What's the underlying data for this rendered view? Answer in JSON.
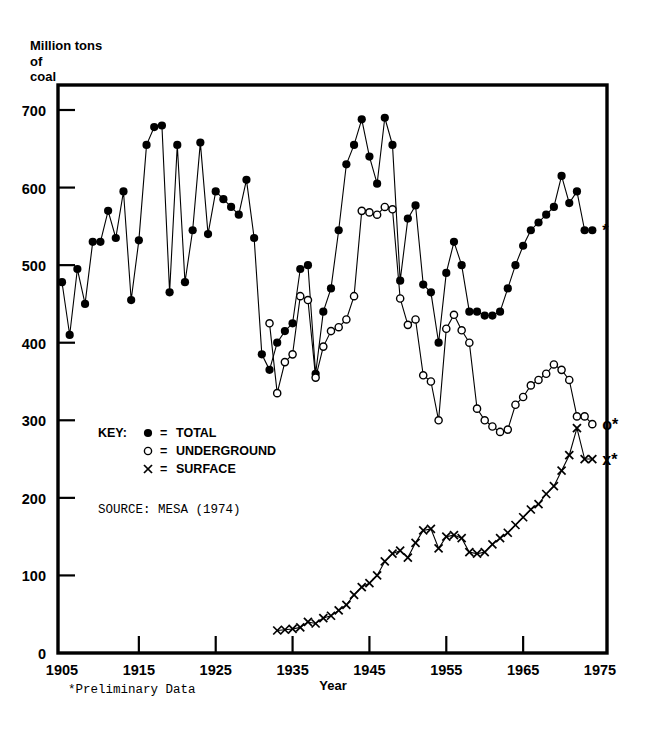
{
  "chart_data": {
    "type": "line",
    "title": "",
    "xlabel": "Year",
    "ylabel": "Million tons of coal",
    "ylabel_lines": [
      "Million tons",
      "of",
      "coal"
    ],
    "xlim": [
      1905,
      1975
    ],
    "ylim": [
      0,
      700
    ],
    "x_ticks": [
      1905,
      1915,
      1925,
      1935,
      1945,
      1955,
      1965,
      1975
    ],
    "y_ticks": [
      0,
      100,
      200,
      300,
      400,
      500,
      600,
      700
    ],
    "grid": false,
    "legend_position": "inside-left",
    "legend_title": "KEY:",
    "series": [
      {
        "name": "TOTAL",
        "marker": "filled-circle",
        "marker_symbol": "●",
        "x": [
          1905,
          1906,
          1907,
          1908,
          1909,
          1910,
          1911,
          1912,
          1913,
          1914,
          1915,
          1916,
          1917,
          1918,
          1919,
          1920,
          1921,
          1922,
          1923,
          1924,
          1925,
          1926,
          1927,
          1928,
          1929,
          1930,
          1931,
          1932,
          1933,
          1934,
          1935,
          1936,
          1937,
          1938,
          1939,
          1940,
          1941,
          1942,
          1943,
          1944,
          1945,
          1946,
          1947,
          1948,
          1949,
          1950,
          1951,
          1952,
          1953,
          1954,
          1955,
          1956,
          1957,
          1958,
          1959,
          1960,
          1961,
          1962,
          1963,
          1964,
          1965,
          1966,
          1967,
          1968,
          1969,
          1970,
          1971,
          1972,
          1973,
          1974
        ],
        "values": [
          478,
          410,
          495,
          450,
          530,
          530,
          570,
          535,
          595,
          455,
          532,
          655,
          678,
          680,
          465,
          655,
          478,
          545,
          658,
          540,
          595,
          585,
          575,
          565,
          610,
          535,
          385,
          365,
          400,
          415,
          425,
          495,
          500,
          360,
          440,
          470,
          545,
          630,
          655,
          688,
          640,
          605,
          690,
          655,
          480,
          560,
          577,
          475,
          465,
          400,
          490,
          530,
          500,
          440,
          440,
          435,
          435,
          440,
          470,
          500,
          525,
          545,
          555,
          565,
          575,
          615,
          580,
          595,
          545,
          545
        ],
        "units": "million tons"
      },
      {
        "name": "UNDERGROUND",
        "marker": "open-circle",
        "marker_symbol": "o",
        "x": [
          1932,
          1933,
          1934,
          1935,
          1936,
          1937,
          1938,
          1939,
          1940,
          1941,
          1942,
          1943,
          1944,
          1945,
          1946,
          1947,
          1948,
          1949,
          1950,
          1951,
          1952,
          1953,
          1954,
          1955,
          1956,
          1957,
          1958,
          1959,
          1960,
          1961,
          1962,
          1963,
          1964,
          1965,
          1966,
          1967,
          1968,
          1969,
          1970,
          1971,
          1972,
          1973,
          1974
        ],
        "values": [
          425,
          335,
          375,
          385,
          460,
          455,
          355,
          395,
          415,
          420,
          430,
          460,
          570,
          568,
          565,
          575,
          572,
          457,
          423,
          430,
          358,
          350,
          300,
          418,
          436,
          416,
          400,
          315,
          300,
          292,
          285,
          288,
          320,
          330,
          345,
          352,
          360,
          372,
          365,
          352,
          305,
          305,
          295
        ],
        "units": "million tons"
      },
      {
        "name": "SURFACE",
        "marker": "cross",
        "marker_symbol": "x",
        "x": [
          1933,
          1934,
          1935,
          1936,
          1937,
          1938,
          1939,
          1940,
          1941,
          1942,
          1943,
          1944,
          1945,
          1946,
          1947,
          1948,
          1949,
          1950,
          1951,
          1952,
          1953,
          1954,
          1955,
          1956,
          1957,
          1958,
          1959,
          1960,
          1961,
          1962,
          1963,
          1964,
          1965,
          1966,
          1967,
          1968,
          1969,
          1970,
          1971,
          1972,
          1973,
          1974
        ],
        "values": [
          29,
          30,
          31,
          33,
          40,
          38,
          45,
          48,
          55,
          62,
          75,
          85,
          90,
          100,
          118,
          128,
          132,
          123,
          142,
          158,
          160,
          135,
          150,
          152,
          148,
          130,
          128,
          130,
          140,
          148,
          155,
          165,
          175,
          185,
          192,
          205,
          215,
          235,
          255,
          290,
          250,
          250
        ],
        "units": "million tons"
      }
    ],
    "annotations": [
      {
        "text": "*",
        "series": "TOTAL",
        "year": 1974,
        "value": 545,
        "meaning": "preliminary"
      },
      {
        "text": "o*",
        "series": "UNDERGROUND",
        "year": 1974,
        "value": 295,
        "meaning": "preliminary"
      },
      {
        "text": "x*",
        "series": "SURFACE",
        "year": 1974,
        "value": 250,
        "meaning": "preliminary"
      }
    ]
  },
  "legend": {
    "title": "KEY:",
    "entries": [
      {
        "symbol": "●",
        "equals": "=",
        "label": "TOTAL"
      },
      {
        "symbol": "o",
        "equals": "=",
        "label": "UNDERGROUND"
      },
      {
        "symbol": "x",
        "equals": "=",
        "label": "SURFACE"
      }
    ]
  },
  "notes": {
    "source": "SOURCE:  MESA (1974)",
    "footnote": "*Preliminary Data"
  },
  "labels": {
    "y_axis_line1": "Million tons",
    "y_axis_line2": "of",
    "y_axis_line3": "coal",
    "x_axis": "Year"
  },
  "colors": {
    "ink": "#000000",
    "background": "#ffffff"
  }
}
